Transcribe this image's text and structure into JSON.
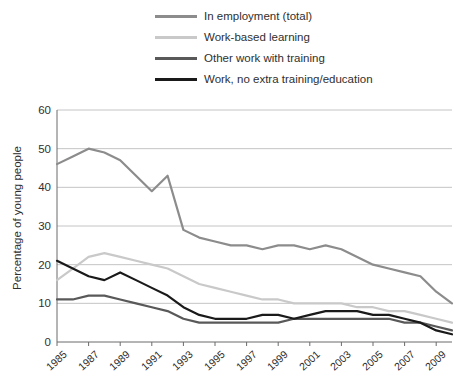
{
  "legend": {
    "position": "top",
    "items": [
      {
        "label": "In employment (total)",
        "color": "#8c8c8c"
      },
      {
        "label": "Work-based learning",
        "color": "#c9c9c9"
      },
      {
        "label": "Other work with training",
        "color": "#595959"
      },
      {
        "label": "Work, no extra training/education",
        "color": "#1a1a1a"
      }
    ]
  },
  "chart_data": {
    "type": "line",
    "title": "",
    "xlabel": "",
    "ylabel": "Percentage of young people",
    "ylim": [
      0,
      60
    ],
    "yticks": [
      0,
      10,
      20,
      30,
      40,
      50,
      60
    ],
    "grid": true,
    "x": [
      1985,
      1986,
      1987,
      1988,
      1989,
      1990,
      1991,
      1992,
      1993,
      1994,
      1995,
      1996,
      1997,
      1998,
      1999,
      2000,
      2001,
      2002,
      2003,
      2004,
      2005,
      2006,
      2007,
      2008,
      2009,
      2010
    ],
    "xticklabels": [
      "1985",
      "1987",
      "1989",
      "1991",
      "1993",
      "1995",
      "1997",
      "1999",
      "2001",
      "2003",
      "2005",
      "2007",
      "2009"
    ],
    "series": [
      {
        "name": "In employment (total)",
        "color": "#8c8c8c",
        "values": [
          46,
          48,
          50,
          49,
          47,
          43,
          39,
          43,
          29,
          27,
          26,
          25,
          25,
          24,
          25,
          25,
          24,
          25,
          24,
          22,
          20,
          19,
          18,
          17,
          13,
          10
        ]
      },
      {
        "name": "Work-based learning",
        "color": "#c9c9c9",
        "values": [
          16,
          19,
          22,
          23,
          22,
          21,
          20,
          19,
          17,
          15,
          14,
          13,
          12,
          11,
          11,
          10,
          10,
          10,
          10,
          9,
          9,
          8,
          8,
          7,
          6,
          5
        ]
      },
      {
        "name": "Other work with training",
        "color": "#595959",
        "values": [
          11,
          11,
          12,
          12,
          11,
          10,
          9,
          8,
          6,
          5,
          5,
          5,
          5,
          5,
          5,
          6,
          6,
          6,
          6,
          6,
          6,
          6,
          5,
          5,
          4,
          3
        ]
      },
      {
        "name": "Work, no extra training/education",
        "color": "#1a1a1a",
        "values": [
          21,
          19,
          17,
          16,
          18,
          16,
          14,
          12,
          9,
          7,
          6,
          6,
          6,
          7,
          7,
          6,
          7,
          8,
          8,
          8,
          7,
          7,
          6,
          5,
          3,
          2
        ]
      }
    ]
  }
}
